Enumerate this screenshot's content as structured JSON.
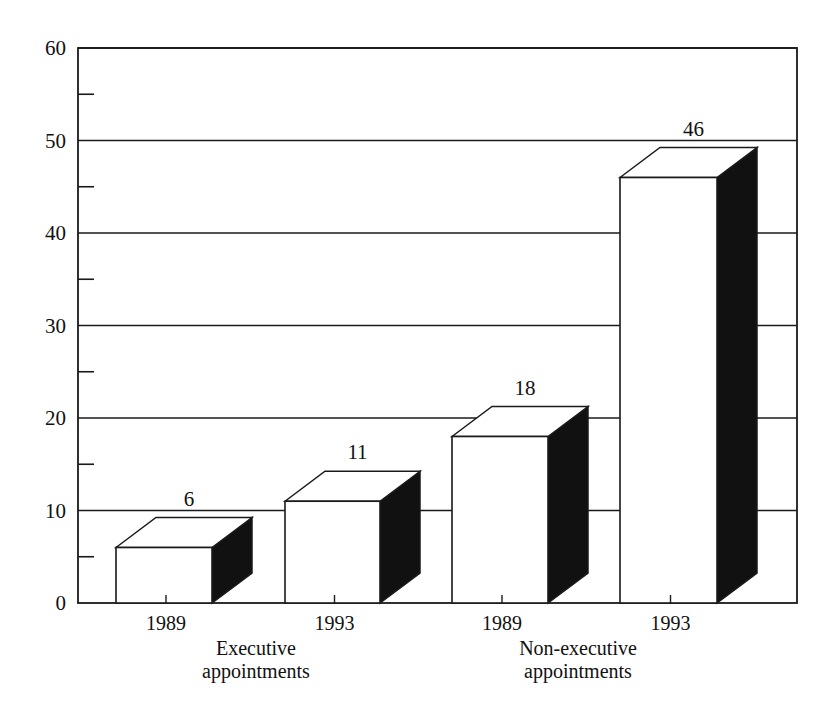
{
  "chart_data": {
    "type": "bar",
    "style": "3d-bar",
    "title": "",
    "xlabel": "",
    "ylabel": "",
    "ylim": [
      0,
      60
    ],
    "y_ticks": [
      0,
      10,
      20,
      30,
      40,
      50,
      60
    ],
    "y_minor_ticks": [
      5,
      15,
      25,
      35,
      45,
      55
    ],
    "grid": true,
    "legend": null,
    "categories": [
      "1989",
      "1993",
      "1989",
      "1993"
    ],
    "groups": [
      {
        "label_line1": "Executive",
        "label_line2": "appointments",
        "categories": [
          "1989",
          "1993"
        ],
        "values": [
          6,
          11
        ]
      },
      {
        "label_line1": "Non-executive",
        "label_line2": "appointments",
        "categories": [
          "1989",
          "1993"
        ],
        "values": [
          18,
          46
        ]
      }
    ],
    "values": [
      6,
      11,
      18,
      46
    ],
    "data_labels": [
      "6",
      "11",
      "18",
      "46"
    ],
    "colors": {
      "front": "#ffffff",
      "top": "#ffffff",
      "side": "#111111",
      "line": "#1a1a1a"
    }
  }
}
